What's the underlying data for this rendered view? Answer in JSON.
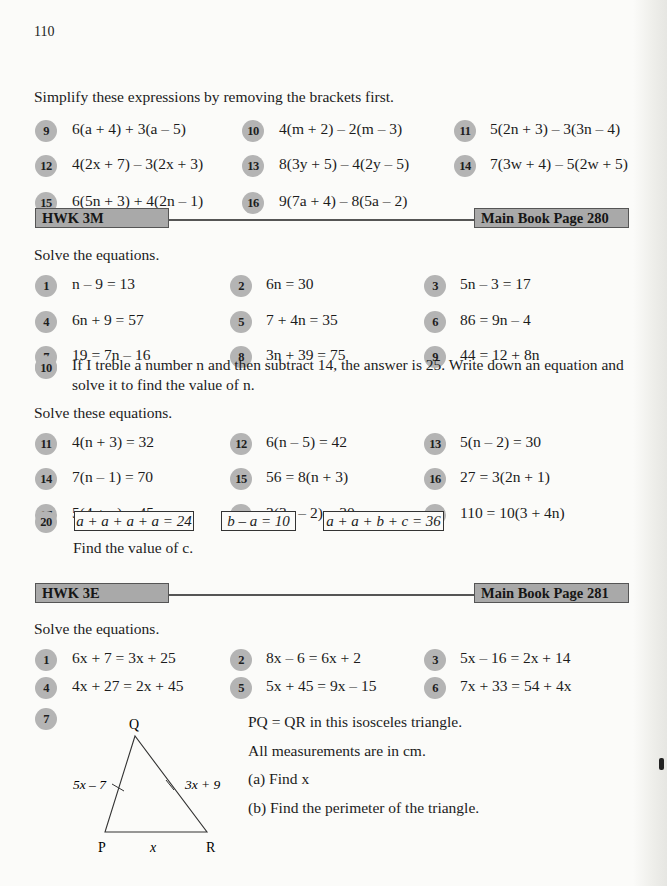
{
  "page_number": "110",
  "simplify_section": {
    "instruction": "Simplify these expressions by removing the brackets first.",
    "questions": [
      {
        "num": "9",
        "expr": "6(a + 4) + 3(a – 5)"
      },
      {
        "num": "10",
        "expr": "4(m + 2) – 2(m – 3)"
      },
      {
        "num": "11",
        "expr": "5(2n + 3) – 3(3n – 4)"
      },
      {
        "num": "12",
        "expr": "4(2x + 7) – 3(2x + 3)"
      },
      {
        "num": "13",
        "expr": "8(3y + 5) – 4(2y – 5)"
      },
      {
        "num": "14",
        "expr": "7(3w + 4) – 5(2w + 5)"
      },
      {
        "num": "15",
        "expr": "6(5n + 3) + 4(2n – 1)"
      },
      {
        "num": "16",
        "expr": "9(7a + 4) – 8(5a – 2)"
      }
    ]
  },
  "hwk3m": {
    "title": "HWK 3M",
    "page_ref": "Main Book Page 280",
    "instruction1": "Solve the equations.",
    "questions": [
      {
        "num": "1",
        "expr": "n – 9 = 13"
      },
      {
        "num": "2",
        "expr": "6n = 30"
      },
      {
        "num": "3",
        "expr": "5n – 3 = 17"
      },
      {
        "num": "4",
        "expr": "6n + 9 = 57"
      },
      {
        "num": "5",
        "expr": "7 + 4n = 35"
      },
      {
        "num": "6",
        "expr": "86 = 9n – 4"
      },
      {
        "num": "7",
        "expr": "19 = 7n – 16"
      },
      {
        "num": "8",
        "expr": "3n + 39 = 75"
      },
      {
        "num": "9",
        "expr": "44 = 12 + 8n"
      }
    ],
    "q10": {
      "num": "10",
      "line1": "If I treble a number n and then subtract 14, the answer is 25. Write down an equation and",
      "line2": "solve it to find the value of n."
    },
    "instruction2": "Solve these equations.",
    "questions2": [
      {
        "num": "11",
        "expr": "4(n + 3) = 32"
      },
      {
        "num": "12",
        "expr": "6(n – 5) = 42"
      },
      {
        "num": "13",
        "expr": "5(n – 2) = 30"
      },
      {
        "num": "14",
        "expr": "7(n – 1) = 70"
      },
      {
        "num": "15",
        "expr": "56 = 8(n + 3)"
      },
      {
        "num": "16",
        "expr": "27 = 3(2n + 1)"
      },
      {
        "num": "17",
        "expr": "5(4 + n) = 45"
      },
      {
        "num": "18",
        "expr": "3(3n – 2) = 30"
      },
      {
        "num": "19",
        "expr": "110 = 10(3 + 4n)"
      }
    ],
    "q20": {
      "num": "20",
      "boxes": [
        "a + a + a + a = 24",
        "b – a = 10",
        "a + a + b + c = 36"
      ],
      "prompt": "Find the value of c."
    }
  },
  "hwk3e": {
    "title": "HWK 3E",
    "page_ref": "Main Book Page 281",
    "instruction": "Solve the equations.",
    "questions": [
      {
        "num": "1",
        "expr": "6x + 7 = 3x + 25"
      },
      {
        "num": "2",
        "expr": "8x – 6 = 6x + 2"
      },
      {
        "num": "3",
        "expr": "5x – 16 = 2x + 14"
      },
      {
        "num": "4",
        "expr": "4x + 27 = 2x + 45"
      },
      {
        "num": "5",
        "expr": "5x + 45 = 9x – 15"
      },
      {
        "num": "6",
        "expr": "7x + 33 = 54 + 4x"
      }
    ],
    "q7": {
      "num": "7",
      "triangle": {
        "vertex_top": "Q",
        "vertex_left": "P",
        "vertex_right": "R",
        "side_pq": "5x – 7",
        "side_qr": "3x + 9",
        "side_pr": "x"
      },
      "text1": "PQ = QR in this isosceles triangle.",
      "text2": "All measurements are in cm.",
      "part_a": "(a)  Find x",
      "part_b": "(b)  Find the perimeter of the triangle."
    }
  }
}
